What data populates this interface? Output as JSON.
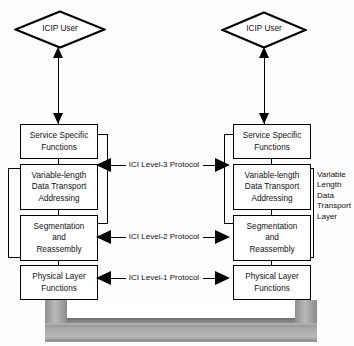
{
  "diagram": {
    "colors": {
      "stroke": "#000000",
      "background": "#ffffff",
      "medium_light": "#d8d8d8",
      "medium_mid": "#a8a8a8",
      "medium_dark": "#7d7d7d"
    },
    "users": [
      {
        "id": "left-user",
        "label": "ICIP User"
      },
      {
        "id": "right-user",
        "label": "ICIP User"
      }
    ],
    "left_stack": [
      {
        "id": "ssf",
        "lines": [
          "Service Specific",
          "Functions"
        ]
      },
      {
        "id": "vldta",
        "lines": [
          "Variable-length",
          "Data Transport",
          "Addressing"
        ]
      },
      {
        "id": "sar",
        "lines": [
          "Segmentation",
          "and",
          "Reassembly"
        ]
      },
      {
        "id": "plf",
        "lines": [
          "Physical Layer",
          "Functions"
        ]
      }
    ],
    "right_stack": [
      {
        "id": "ssf",
        "lines": [
          "Service Specific",
          "Functions"
        ]
      },
      {
        "id": "vldta",
        "lines": [
          "Variable-length",
          "Data Transport",
          "Addressing"
        ]
      },
      {
        "id": "sar",
        "lines": [
          "Segmentation",
          "and",
          "Reassembly"
        ]
      },
      {
        "id": "plf",
        "lines": [
          "Physical Layer",
          "Functions"
        ]
      }
    ],
    "protocols": [
      {
        "id": "level-3",
        "label": "ICI Level-3 Protocol"
      },
      {
        "id": "level-2",
        "label": "ICI Level-2 Protocol"
      },
      {
        "id": "level-1",
        "label": "ICI Level-1 Protocol"
      }
    ],
    "layer_annotation": {
      "id": "variable-length-data-transport-layer",
      "lines": [
        "Variable",
        "Length",
        "Data",
        "Transport",
        "Layer"
      ]
    }
  }
}
